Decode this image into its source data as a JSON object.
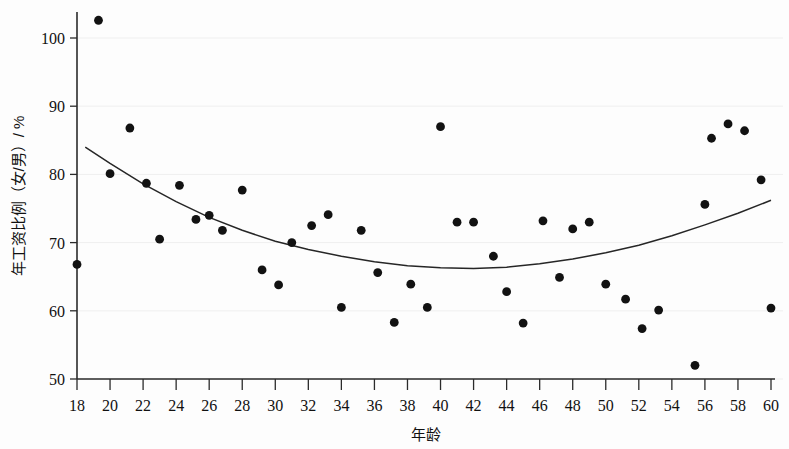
{
  "chart_data": {
    "type": "scatter",
    "title": "",
    "xlabel": "年龄",
    "ylabel": "年工资比例（女/男）/ %",
    "xlim": [
      18,
      60
    ],
    "ylim": [
      50,
      103
    ],
    "xticks": [
      18,
      20,
      22,
      24,
      26,
      28,
      30,
      32,
      34,
      36,
      38,
      40,
      42,
      44,
      46,
      48,
      50,
      52,
      54,
      56,
      58,
      60
    ],
    "yticks": [
      50,
      60,
      70,
      80,
      90,
      100
    ],
    "grid": true,
    "legend": "none",
    "point_color": "#121212",
    "curve_color": "#262626",
    "x": [
      18.0,
      19.3,
      20.0,
      21.2,
      22.2,
      23.0,
      24.2,
      25.2,
      26.0,
      26.8,
      28.0,
      29.2,
      30.2,
      31.0,
      32.2,
      33.2,
      34.0,
      35.2,
      36.2,
      37.2,
      38.2,
      39.2,
      40.0,
      41.0,
      42.0,
      43.2,
      44.0,
      45.0,
      46.2,
      47.2,
      48.0,
      49.0,
      50.0,
      51.2,
      52.2,
      53.2,
      55.4,
      56.0,
      56.4,
      57.4,
      58.4,
      59.4,
      60.0
    ],
    "y": [
      66.8,
      102.6,
      80.1,
      86.8,
      78.7,
      70.5,
      78.4,
      73.4,
      74.0,
      71.8,
      77.7,
      66.0,
      63.8,
      70.0,
      72.5,
      74.1,
      60.5,
      71.8,
      65.6,
      58.3,
      63.9,
      60.5,
      87.0,
      73.0,
      73.0,
      68.0,
      62.8,
      58.2,
      73.2,
      64.9,
      72.0,
      73.0,
      63.9,
      61.7,
      57.4,
      60.1,
      52.0,
      75.6,
      85.3,
      87.4,
      86.4,
      79.2,
      60.4
    ],
    "series": [
      {
        "name": "年工资比例观测值",
        "points": [
          {
            "x": 18.0,
            "y": 66.8
          },
          {
            "x": 19.3,
            "y": 102.6
          },
          {
            "x": 20.0,
            "y": 80.1
          },
          {
            "x": 21.2,
            "y": 86.8
          },
          {
            "x": 22.2,
            "y": 78.7
          },
          {
            "x": 23.0,
            "y": 70.5
          },
          {
            "x": 24.2,
            "y": 78.4
          },
          {
            "x": 25.2,
            "y": 73.4
          },
          {
            "x": 26.0,
            "y": 74.0
          },
          {
            "x": 26.8,
            "y": 71.8
          },
          {
            "x": 28.0,
            "y": 77.7
          },
          {
            "x": 29.2,
            "y": 66.0
          },
          {
            "x": 30.2,
            "y": 63.8
          },
          {
            "x": 31.0,
            "y": 70.0
          },
          {
            "x": 32.2,
            "y": 72.5
          },
          {
            "x": 33.2,
            "y": 74.1
          },
          {
            "x": 34.0,
            "y": 60.5
          },
          {
            "x": 35.2,
            "y": 71.8
          },
          {
            "x": 36.2,
            "y": 65.6
          },
          {
            "x": 37.2,
            "y": 58.3
          },
          {
            "x": 38.2,
            "y": 63.9
          },
          {
            "x": 39.2,
            "y": 60.5
          },
          {
            "x": 40.0,
            "y": 87.0
          },
          {
            "x": 41.0,
            "y": 73.0
          },
          {
            "x": 42.0,
            "y": 73.0
          },
          {
            "x": 43.2,
            "y": 68.0
          },
          {
            "x": 44.0,
            "y": 62.8
          },
          {
            "x": 45.0,
            "y": 58.2
          },
          {
            "x": 46.2,
            "y": 73.2
          },
          {
            "x": 47.2,
            "y": 64.9
          },
          {
            "x": 48.0,
            "y": 72.0
          },
          {
            "x": 49.0,
            "y": 73.0
          },
          {
            "x": 50.0,
            "y": 63.9
          },
          {
            "x": 51.2,
            "y": 61.7
          },
          {
            "x": 52.2,
            "y": 57.4
          },
          {
            "x": 53.2,
            "y": 60.1
          },
          {
            "x": 55.4,
            "y": 52.0
          },
          {
            "x": 56.0,
            "y": 75.6
          },
          {
            "x": 56.4,
            "y": 85.3
          },
          {
            "x": 57.4,
            "y": 87.4
          },
          {
            "x": 58.4,
            "y": 86.4
          },
          {
            "x": 59.4,
            "y": 79.2
          },
          {
            "x": 60.0,
            "y": 60.4
          }
        ]
      }
    ],
    "fit_curve": {
      "name": "二次拟合曲线",
      "type": "quadratic",
      "x_start": 18.5,
      "x_end": 60.0,
      "points": [
        {
          "x": 18.5,
          "y": 84.0
        },
        {
          "x": 20.0,
          "y": 81.6
        },
        {
          "x": 22.0,
          "y": 78.6
        },
        {
          "x": 24.0,
          "y": 76.0
        },
        {
          "x": 26.0,
          "y": 73.7
        },
        {
          "x": 28.0,
          "y": 71.8
        },
        {
          "x": 30.0,
          "y": 70.2
        },
        {
          "x": 32.0,
          "y": 69.0
        },
        {
          "x": 34.0,
          "y": 68.0
        },
        {
          "x": 36.0,
          "y": 67.2
        },
        {
          "x": 38.0,
          "y": 66.6
        },
        {
          "x": 40.0,
          "y": 66.3
        },
        {
          "x": 42.0,
          "y": 66.2
        },
        {
          "x": 44.0,
          "y": 66.4
        },
        {
          "x": 46.0,
          "y": 66.9
        },
        {
          "x": 48.0,
          "y": 67.6
        },
        {
          "x": 50.0,
          "y": 68.5
        },
        {
          "x": 52.0,
          "y": 69.6
        },
        {
          "x": 54.0,
          "y": 71.0
        },
        {
          "x": 56.0,
          "y": 72.6
        },
        {
          "x": 58.0,
          "y": 74.3
        },
        {
          "x": 60.0,
          "y": 76.2
        }
      ]
    }
  },
  "axes": {
    "y_axis_label": "年工资比例（女/男）/ %",
    "x_axis_label": "年龄",
    "y_tick_labels": [
      "100",
      "90",
      "80",
      "70",
      "60",
      "50"
    ],
    "x_tick_labels": [
      "18",
      "20",
      "22",
      "24",
      "26",
      "28",
      "30",
      "32",
      "34",
      "36",
      "38",
      "40",
      "42",
      "44",
      "46",
      "48",
      "50",
      "52",
      "54",
      "56",
      "58",
      "60"
    ]
  }
}
